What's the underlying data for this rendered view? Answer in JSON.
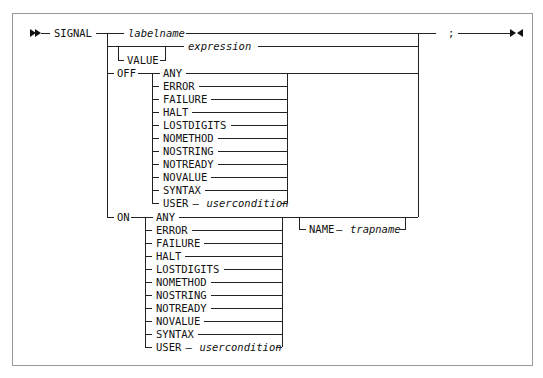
{
  "diagram": {
    "type": "railroad-syntax-diagram",
    "statement": "SIGNAL",
    "terminator": ";",
    "main_branches": [
      {
        "keyword": "",
        "variable": "labelname"
      },
      {
        "keyword": "VALUE",
        "keyword_optional": true,
        "variable": "expression"
      },
      {
        "keyword": "OFF",
        "choices_ref": "conditions"
      },
      {
        "keyword": "ON",
        "choices_ref": "conditions",
        "optional_suffix": {
          "keyword": "NAME",
          "variable": "trapname"
        }
      }
    ],
    "labels": {
      "signal": "SIGNAL",
      "labelname": "labelname",
      "value": "VALUE",
      "expression": "expression",
      "off": "OFF",
      "on": "ON",
      "semicolon": ";",
      "name": "NAME",
      "trapname": "trapname",
      "dash": "—"
    },
    "off_conditions": [
      "ANY",
      "ERROR",
      "FAILURE",
      "HALT",
      "LOSTDIGITS",
      "NOMETHOD",
      "NOSTRING",
      "NOTREADY",
      "NOVALUE",
      "SYNTAX",
      "USER"
    ],
    "on_conditions": [
      "ANY",
      "ERROR",
      "FAILURE",
      "HALT",
      "LOSTDIGITS",
      "NOMETHOD",
      "NOSTRING",
      "NOTREADY",
      "NOVALUE",
      "SYNTAX",
      "USER"
    ],
    "user_variable": "usercondition",
    "markers": {
      "start": "double-right-arrow",
      "end": "bowtie-end"
    }
  }
}
